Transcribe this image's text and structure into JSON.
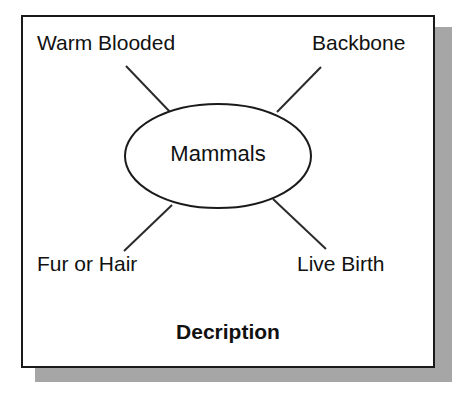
{
  "diagram": {
    "type": "concept-web",
    "center": {
      "label": "Mammals",
      "shape": "ellipse"
    },
    "footer_title": "Decription",
    "nodes": [
      {
        "id": "warm-blooded",
        "label": "Warm Blooded",
        "position": "top-left"
      },
      {
        "id": "backbone",
        "label": "Backbone",
        "position": "top-right"
      },
      {
        "id": "fur-or-hair",
        "label": "Fur or Hair",
        "position": "bottom-left"
      },
      {
        "id": "live-birth",
        "label": "Live Birth",
        "position": "bottom-right"
      }
    ],
    "connectors": [
      {
        "from": "warm-blooded",
        "to": "center"
      },
      {
        "from": "backbone",
        "to": "center"
      },
      {
        "from": "fur-or-hair",
        "to": "center"
      },
      {
        "from": "live-birth",
        "to": "center"
      }
    ],
    "colors": {
      "background": "#ffffff",
      "card_background": "#ffffff",
      "border": "#1a1a1a",
      "shadow": "#a6a6a6",
      "text": "#111111",
      "line": "#2b2b2b"
    }
  }
}
